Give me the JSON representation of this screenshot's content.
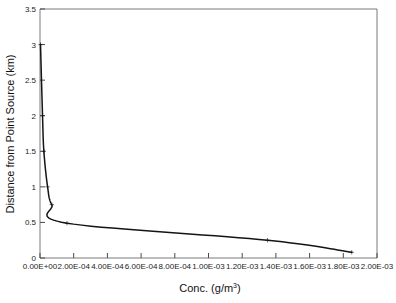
{
  "chart_data": {
    "type": "line",
    "title": "",
    "xlabel": "Conc. (g/m3)",
    "xlabel_base": "Conc. (g/m",
    "xlabel_sup": "3",
    "xlabel_tail": ")",
    "ylabel": "Distance from Point Source (km)",
    "xlim": [
      0,
      0.002
    ],
    "ylim": [
      0,
      3.5
    ],
    "grid": false,
    "legend": "none",
    "marker": "plus",
    "line_color": "#141414",
    "x_tick_labels": [
      "0.00E+00",
      "2.00E-04",
      "4.00E-04",
      "6.00E-04",
      "8.00E-04",
      "1.00E-03",
      "1.20E-03",
      "1.40E-03",
      "1.60E-03",
      "1.80E-03",
      "2.00E-03"
    ],
    "x_tick_values": [
      0,
      0.0002,
      0.0004,
      0.0006,
      0.0008,
      0.001,
      0.0012,
      0.0014,
      0.0016,
      0.0018,
      0.002
    ],
    "y_tick_labels": [
      "0",
      "0.5",
      "1",
      "1.5",
      "2",
      "2.5",
      "3",
      "3.5"
    ],
    "y_tick_values": [
      0,
      0.5,
      1,
      1.5,
      2,
      2.5,
      3,
      3.5
    ],
    "series": [
      {
        "name": "Concentration vs distance",
        "x": [
          3e-06,
          1.5e-05,
          2.3e-05,
          4.5e-05,
          7e-05,
          0.00016,
          0.00135,
          0.00185
        ],
        "y": [
          3.0,
          2.0,
          1.5,
          1.0,
          0.75,
          0.49,
          0.25,
          0.08
        ]
      }
    ]
  }
}
